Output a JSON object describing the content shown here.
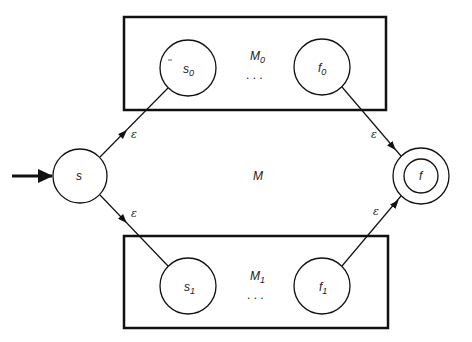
{
  "diagram": {
    "center_label": "M",
    "start_state": {
      "label": "s"
    },
    "final_state": {
      "label": "f"
    },
    "machines": [
      {
        "name": "M",
        "name_sub": "0",
        "start": "s",
        "start_sub": "0",
        "final": "f",
        "final_sub": "0",
        "ellipsis": ". . ."
      },
      {
        "name": "M",
        "name_sub": "1",
        "start": "s",
        "start_sub": "1",
        "final": "f",
        "final_sub": "1",
        "ellipsis": ". . ."
      }
    ],
    "edges": [
      {
        "from": "s",
        "to": "s0",
        "label": "ε"
      },
      {
        "from": "s",
        "to": "s1",
        "label": "ε"
      },
      {
        "from": "f0",
        "to": "f",
        "label": "ε"
      },
      {
        "from": "f1",
        "to": "f",
        "label": "ε"
      }
    ],
    "colors": {
      "stroke": "#111111",
      "background": "#ffffff"
    }
  }
}
